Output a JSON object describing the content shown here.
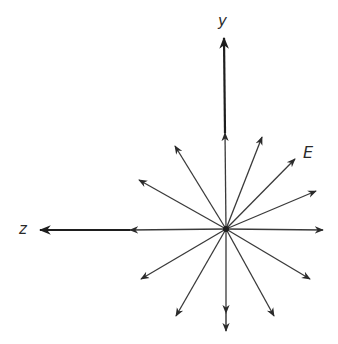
{
  "diagram": {
    "labels": {
      "y_axis": "y",
      "z_axis": "z",
      "field": "E"
    },
    "colors": {
      "line": "#3a3a3a",
      "axis": "#1e1e1e",
      "background": "#ffffff"
    },
    "origin": [
      226,
      229
    ],
    "field_vectors": [
      {
        "id": "up",
        "tip": [
          225,
          133
        ]
      },
      {
        "id": "up-right-steep",
        "tip": [
          262,
          137
        ]
      },
      {
        "id": "up-right-mid",
        "tip": [
          295,
          159
        ]
      },
      {
        "id": "up-right-shallow",
        "tip": [
          316,
          191
        ]
      },
      {
        "id": "right",
        "tip": [
          323,
          230
        ]
      },
      {
        "id": "down-right-shallow",
        "tip": [
          310,
          279
        ]
      },
      {
        "id": "down-right-steep",
        "tip": [
          274,
          316
        ]
      },
      {
        "id": "down",
        "tip": [
          226,
          313
        ]
      },
      {
        "id": "down-left-steep",
        "tip": [
          176,
          316
        ]
      },
      {
        "id": "down-left-shallow",
        "tip": [
          141,
          279
        ]
      },
      {
        "id": "left",
        "tip": [
          130,
          230
        ]
      },
      {
        "id": "up-left-shallow",
        "tip": [
          139,
          180
        ]
      },
      {
        "id": "up-left-steep",
        "tip": [
          175,
          146
        ]
      }
    ],
    "axes": [
      {
        "id": "y-axis",
        "from": [
          225,
          133
        ],
        "tip": [
          224,
          38
        ]
      },
      {
        "id": "z-axis",
        "from": [
          130,
          230
        ],
        "tip": [
          40,
          230
        ]
      },
      {
        "id": "down-extension",
        "from": [
          226,
          313
        ],
        "tip": [
          226,
          331
        ]
      }
    ]
  }
}
